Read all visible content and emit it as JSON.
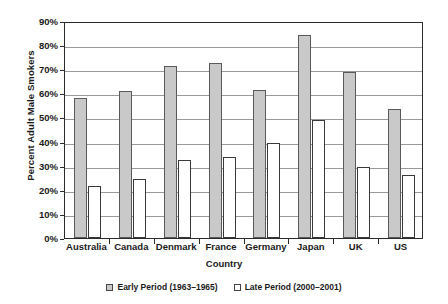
{
  "chart_data": {
    "type": "bar",
    "title": "",
    "xlabel": "Country",
    "ylabel": "Percent Adult Male Smokers",
    "categories": [
      "Australia",
      "Canada",
      "Denmark",
      "France",
      "Germany",
      "Japan",
      "UK",
      "US"
    ],
    "series": [
      {
        "name": "Early Period (1963–1965)",
        "color": "#c9c9c9",
        "values": [
          58,
          61,
          71.5,
          72.5,
          61.5,
          84,
          69,
          53.5
        ]
      },
      {
        "name": "Late Period (2000–2001)",
        "color": "#ffffff",
        "values": [
          21.5,
          24.5,
          32.5,
          33.5,
          39.5,
          49,
          29.5,
          26
        ]
      }
    ],
    "ylim": [
      0,
      90
    ],
    "ytick_labels": [
      "0%",
      "10%",
      "20%",
      "30%",
      "40%",
      "50%",
      "60%",
      "70%",
      "80%",
      "90%"
    ],
    "ytick_values": [
      0,
      10,
      20,
      30,
      40,
      50,
      60,
      70,
      80,
      90
    ],
    "grid": "horizontal",
    "legend_position": "bottom"
  },
  "axis": {
    "y_title": "Percent Adult Male Smokers",
    "x_title": "Country"
  },
  "legend": {
    "items": [
      {
        "label": "Early Period (1963–1965)"
      },
      {
        "label": "Late Period (2000–2001)"
      }
    ]
  }
}
